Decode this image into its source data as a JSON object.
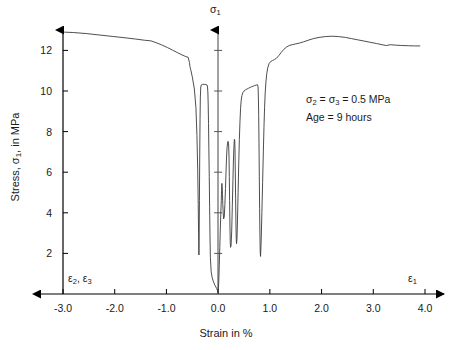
{
  "figure": {
    "background_color": "#ffffff",
    "curve_color": "#3a3a3a",
    "axis_color": "#000000"
  },
  "axes": {
    "x_title": "Strain in %",
    "y_title_prefix": "Stress, ",
    "y_title_symbol": "σ",
    "y_title_sub": "1",
    "y_title_suffix": ", in MPa",
    "vertical_axis_symbol": "σ",
    "vertical_axis_sub": "1",
    "left_strain_symbol_1": "ε",
    "left_strain_sub_1": "2",
    "left_strain_sep": ", ",
    "left_strain_symbol_2": "ε",
    "left_strain_sub_2": "3",
    "right_strain_symbol": "ε",
    "right_strain_sub": "1",
    "x_ticks": [
      "-3.0",
      "-2.0",
      "-1.0",
      "0.0",
      "1.0",
      "2.0",
      "3.0",
      "4.0"
    ],
    "y_ticks": [
      "2",
      "4",
      "6",
      "8",
      "10",
      "12"
    ]
  },
  "annotation": {
    "line1_a": "σ",
    "line1_sub_a": "2",
    "line1_mid": " = ",
    "line1_b": "σ",
    "line1_sub_b": "3",
    "line1_tail": " = 0.5 MPa",
    "line2": "Age = 9 hours"
  },
  "chart_data": {
    "type": "line",
    "title": "",
    "xlabel": "Strain in %",
    "ylabel": "Stress, σ₁, in MPa",
    "xlim": [
      -3.0,
      4.0
    ],
    "ylim": [
      0,
      13.3
    ],
    "xticks": [
      -3.0,
      -2.0,
      -1.0,
      0.0,
      1.0,
      2.0,
      3.0,
      4.0
    ],
    "yticks": [
      2,
      4,
      6,
      8,
      10,
      12
    ],
    "grid": false,
    "legend": null,
    "annotations": [
      "σ₂ = σ₃ = 0.5 MPa",
      "Age = 9 hours"
    ],
    "series": [
      {
        "name": "lateral strain (ε₂, ε₃)",
        "points": [
          [
            -2.97,
            12.9
          ],
          [
            -2.8,
            12.88
          ],
          [
            -2.55,
            12.83
          ],
          [
            -2.3,
            12.76
          ],
          [
            -2.05,
            12.69
          ],
          [
            -1.8,
            12.62
          ],
          [
            -1.6,
            12.56
          ],
          [
            -1.42,
            12.5
          ],
          [
            -1.3,
            12.47
          ],
          [
            -1.22,
            12.4
          ],
          [
            -1.1,
            12.28
          ],
          [
            -0.98,
            12.14
          ],
          [
            -0.88,
            12.01
          ],
          [
            -0.78,
            11.88
          ],
          [
            -0.7,
            11.78
          ],
          [
            -0.63,
            11.7
          ],
          [
            -0.58,
            11.66
          ],
          [
            -0.555,
            11.4
          ],
          [
            -0.545,
            11.2
          ],
          [
            -0.53,
            11.05
          ],
          [
            -0.5,
            10.7
          ],
          [
            -0.46,
            10.1
          ],
          [
            -0.43,
            9.2
          ],
          [
            -0.41,
            7.8
          ],
          [
            -0.395,
            6.1
          ],
          [
            -0.385,
            4.4
          ],
          [
            -0.378,
            3.0
          ],
          [
            -0.372,
            1.92
          ],
          [
            -0.368,
            2.6
          ],
          [
            -0.362,
            4.6
          ],
          [
            -0.356,
            6.8
          ],
          [
            -0.35,
            8.6
          ],
          [
            -0.344,
            9.7
          ],
          [
            -0.336,
            10.2
          ],
          [
            -0.325,
            10.3
          ],
          [
            -0.3,
            10.33
          ],
          [
            -0.27,
            10.33
          ],
          [
            -0.24,
            10.32
          ],
          [
            -0.215,
            10.3
          ],
          [
            -0.205,
            10.2
          ],
          [
            -0.198,
            9.9
          ],
          [
            -0.192,
            9.3
          ],
          [
            -0.186,
            8.4
          ],
          [
            -0.18,
            7.2
          ],
          [
            -0.172,
            5.8
          ],
          [
            -0.165,
            4.3
          ],
          [
            -0.158,
            2.9
          ],
          [
            -0.15,
            1.8
          ],
          [
            -0.135,
            1.1
          ],
          [
            -0.115,
            0.8
          ],
          [
            -0.09,
            0.6
          ],
          [
            -0.06,
            0.42
          ],
          [
            -0.03,
            0.28
          ],
          [
            -0.01,
            0.15
          ],
          [
            0.0,
            0.05
          ]
        ]
      },
      {
        "name": "axial strain (ε₁)",
        "points": [
          [
            0.0,
            0.05
          ],
          [
            0.012,
            0.6
          ],
          [
            0.022,
            1.4
          ],
          [
            0.032,
            2.3
          ],
          [
            0.042,
            3.2
          ],
          [
            0.052,
            4.0
          ],
          [
            0.06,
            4.6
          ],
          [
            0.066,
            5.1
          ],
          [
            0.072,
            5.45
          ],
          [
            0.078,
            5.3
          ],
          [
            0.084,
            4.9
          ],
          [
            0.09,
            4.4
          ],
          [
            0.098,
            4.0
          ],
          [
            0.106,
            3.7
          ],
          [
            0.118,
            3.8
          ],
          [
            0.13,
            4.4
          ],
          [
            0.142,
            5.2
          ],
          [
            0.152,
            6.0
          ],
          [
            0.162,
            6.7
          ],
          [
            0.172,
            7.2
          ],
          [
            0.182,
            7.45
          ],
          [
            0.192,
            7.52
          ],
          [
            0.202,
            7.4
          ],
          [
            0.21,
            6.8
          ],
          [
            0.216,
            5.8
          ],
          [
            0.222,
            4.6
          ],
          [
            0.228,
            3.4
          ],
          [
            0.234,
            2.55
          ],
          [
            0.24,
            2.3
          ],
          [
            0.25,
            2.38
          ],
          [
            0.262,
            3.1
          ],
          [
            0.274,
            4.3
          ],
          [
            0.286,
            5.6
          ],
          [
            0.296,
            6.6
          ],
          [
            0.306,
            7.3
          ],
          [
            0.314,
            7.62
          ],
          [
            0.32,
            7.58
          ],
          [
            0.326,
            7.1
          ],
          [
            0.332,
            6.0
          ],
          [
            0.338,
            4.7
          ],
          [
            0.344,
            3.5
          ],
          [
            0.35,
            2.7
          ],
          [
            0.356,
            2.48
          ],
          [
            0.364,
            2.7
          ],
          [
            0.374,
            3.6
          ],
          [
            0.386,
            5.0
          ],
          [
            0.398,
            6.4
          ],
          [
            0.41,
            7.6
          ],
          [
            0.422,
            8.5
          ],
          [
            0.434,
            9.15
          ],
          [
            0.446,
            9.55
          ],
          [
            0.46,
            9.78
          ],
          [
            0.478,
            9.92
          ],
          [
            0.5,
            10.0
          ],
          [
            0.53,
            10.06
          ],
          [
            0.56,
            10.1
          ],
          [
            0.59,
            10.14
          ],
          [
            0.62,
            10.18
          ],
          [
            0.65,
            10.21
          ],
          [
            0.68,
            10.24
          ],
          [
            0.71,
            10.27
          ],
          [
            0.74,
            10.3
          ],
          [
            0.76,
            10.31
          ],
          [
            0.772,
            10.2
          ],
          [
            0.778,
            9.7
          ],
          [
            0.784,
            8.8
          ],
          [
            0.79,
            7.4
          ],
          [
            0.796,
            5.8
          ],
          [
            0.802,
            4.2
          ],
          [
            0.808,
            2.9
          ],
          [
            0.814,
            2.05
          ],
          [
            0.82,
            1.85
          ],
          [
            0.832,
            2.6
          ],
          [
            0.846,
            4.0
          ],
          [
            0.86,
            5.5
          ],
          [
            0.874,
            7.0
          ],
          [
            0.886,
            8.2
          ],
          [
            0.898,
            9.2
          ],
          [
            0.91,
            9.9
          ],
          [
            0.924,
            10.45
          ],
          [
            0.94,
            10.85
          ],
          [
            0.96,
            11.15
          ],
          [
            0.985,
            11.35
          ],
          [
            1.015,
            11.45
          ],
          [
            1.05,
            11.5
          ],
          [
            1.09,
            11.55
          ],
          [
            1.13,
            11.62
          ],
          [
            1.175,
            11.75
          ],
          [
            1.22,
            11.9
          ],
          [
            1.27,
            12.05
          ],
          [
            1.32,
            12.16
          ],
          [
            1.375,
            12.24
          ],
          [
            1.43,
            12.28
          ],
          [
            1.5,
            12.32
          ],
          [
            1.57,
            12.36
          ],
          [
            1.65,
            12.42
          ],
          [
            1.74,
            12.5
          ],
          [
            1.84,
            12.58
          ],
          [
            1.95,
            12.64
          ],
          [
            2.07,
            12.68
          ],
          [
            2.2,
            12.7
          ],
          [
            2.33,
            12.68
          ],
          [
            2.46,
            12.64
          ],
          [
            2.58,
            12.58
          ],
          [
            2.7,
            12.52
          ],
          [
            2.82,
            12.46
          ],
          [
            2.94,
            12.4
          ],
          [
            3.06,
            12.34
          ],
          [
            3.17,
            12.28
          ],
          [
            3.25,
            12.24
          ],
          [
            3.33,
            12.28
          ],
          [
            3.43,
            12.26
          ],
          [
            3.55,
            12.24
          ],
          [
            3.68,
            12.23
          ],
          [
            3.8,
            12.22
          ],
          [
            3.9,
            12.22
          ]
        ]
      }
    ]
  }
}
